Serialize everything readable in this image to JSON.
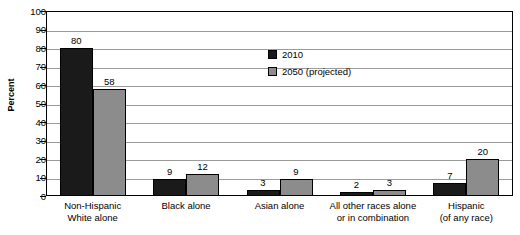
{
  "chart_data": {
    "type": "bar",
    "title": "",
    "xlabel": "",
    "ylabel": "Percent",
    "ylim": [
      0,
      100
    ],
    "ytick_step": 10,
    "yticks": [
      100,
      90,
      80,
      70,
      60,
      50,
      40,
      30,
      20,
      10,
      0
    ],
    "grid": true,
    "legend_position": "upper-center-right inside plot",
    "categories": [
      "Non-Hispanic\nWhite alone",
      "Black alone",
      "Asian alone",
      "All other races alone\nor in combination",
      "Hispanic\n(of any race)"
    ],
    "series": [
      {
        "name": "2010",
        "color": "#1a1a1a",
        "values": [
          80,
          9,
          3,
          2,
          7
        ]
      },
      {
        "name": "2050 (projected)",
        "color": "#8c8c8c",
        "values": [
          58,
          12,
          9,
          3,
          20
        ]
      }
    ]
  }
}
